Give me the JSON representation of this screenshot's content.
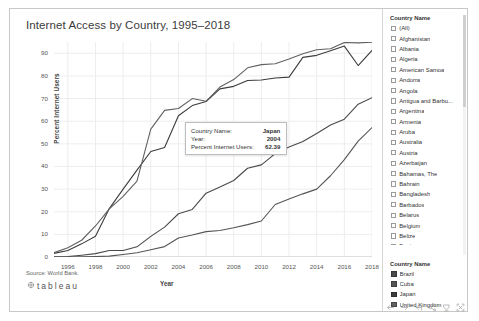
{
  "chart_title": "Internet Access by Country, 1995–2018",
  "source_note": "Source: World Bank.",
  "brand": "tableau",
  "axes": {
    "xlabel": "Year",
    "ylabel": "Percent Internet Users"
  },
  "tooltip": {
    "row1_label": "Country Name:",
    "row1_value": "Japan",
    "row2_label": "Year:",
    "row2_value": "2004",
    "row3_label": "Percent Internet Users:",
    "row3_value": "62.39"
  },
  "filter": {
    "header": "Country Name",
    "items": [
      {
        "label": "(All)",
        "checked": false
      },
      {
        "label": "Afghanistan",
        "checked": false
      },
      {
        "label": "Albania",
        "checked": false
      },
      {
        "label": "Algeria",
        "checked": false
      },
      {
        "label": "American Samoa",
        "checked": false
      },
      {
        "label": "Andorra",
        "checked": false
      },
      {
        "label": "Angola",
        "checked": false
      },
      {
        "label": "Antigua and Barbu...",
        "checked": false
      },
      {
        "label": "Argentina",
        "checked": false
      },
      {
        "label": "Armenia",
        "checked": false
      },
      {
        "label": "Aruba",
        "checked": false
      },
      {
        "label": "Australia",
        "checked": false
      },
      {
        "label": "Austria",
        "checked": false
      },
      {
        "label": "Azerbaijan",
        "checked": false
      },
      {
        "label": "Bahamas, The",
        "checked": false
      },
      {
        "label": "Bahrain",
        "checked": false
      },
      {
        "label": "Bangladesh",
        "checked": false
      },
      {
        "label": "Barbados",
        "checked": false
      },
      {
        "label": "Belarus",
        "checked": false
      },
      {
        "label": "Belgium",
        "checked": false
      },
      {
        "label": "Belize",
        "checked": false
      },
      {
        "label": "Benin",
        "checked": false
      },
      {
        "label": "Bermuda",
        "checked": false
      },
      {
        "label": "Bhutan",
        "checked": false
      },
      {
        "label": "Bolivia",
        "checked": false
      }
    ]
  },
  "color_legend": {
    "header": "Country Name",
    "items": [
      {
        "label": "Brazil",
        "color": "#4a4a4a"
      },
      {
        "label": "Cuba",
        "color": "#555555"
      },
      {
        "label": "Japan",
        "color": "#3c3c3c"
      },
      {
        "label": "United Kingdom",
        "color": "#606060"
      }
    ]
  },
  "toolbar": {
    "items": [
      {
        "name": "back-icon",
        "title": "Back"
      },
      {
        "name": "forward-icon",
        "title": "Forward"
      },
      {
        "name": "revert-icon",
        "title": "Revert"
      },
      {
        "name": "share-icon",
        "title": "Share"
      },
      {
        "name": "download-icon",
        "title": "Download"
      },
      {
        "name": "fullscreen-icon",
        "title": "Full Screen"
      }
    ]
  },
  "chart_data": {
    "type": "line",
    "title": "Internet Access by Country, 1995–2018",
    "xlabel": "Year",
    "ylabel": "Percent Internet Users",
    "xlim": [
      1995,
      2018
    ],
    "ylim": [
      0,
      95
    ],
    "xticks": [
      1996,
      1998,
      2000,
      2002,
      2004,
      2006,
      2008,
      2010,
      2012,
      2014,
      2016,
      2018
    ],
    "yticks": [
      0,
      10,
      20,
      30,
      40,
      50,
      60,
      70,
      80,
      90
    ],
    "grid": true,
    "legend_position": "right",
    "x": [
      1995,
      1996,
      1997,
      1998,
      1999,
      2000,
      2001,
      2002,
      2003,
      2004,
      2005,
      2006,
      2007,
      2008,
      2009,
      2010,
      2011,
      2012,
      2013,
      2014,
      2015,
      2016,
      2017,
      2018
    ],
    "series": [
      {
        "name": "Japan",
        "color": "#3c3c3c",
        "values": [
          1.6,
          2.9,
          5.8,
          9.2,
          21.4,
          30.0,
          38.4,
          46.6,
          48.4,
          62.39,
          66.9,
          68.7,
          74.3,
          75.4,
          78.0,
          78.2,
          79.1,
          79.5,
          88.2,
          89.1,
          91.1,
          93.2,
          84.6,
          91.3
        ]
      },
      {
        "name": "United Kingdom",
        "color": "#606060",
        "values": [
          1.9,
          4.1,
          7.4,
          13.7,
          21.3,
          26.8,
          33.5,
          56.5,
          64.8,
          65.6,
          70.0,
          68.8,
          75.1,
          78.4,
          83.6,
          85.0,
          85.4,
          87.5,
          89.8,
          91.6,
          92.0,
          94.8,
          94.6,
          94.9
        ]
      },
      {
        "name": "Brazil",
        "color": "#4a4a4a",
        "values": [
          0.1,
          0.2,
          0.8,
          1.5,
          2.9,
          2.9,
          4.5,
          9.1,
          13.2,
          19.1,
          21.0,
          28.2,
          30.9,
          33.8,
          39.2,
          40.7,
          45.7,
          48.6,
          51.0,
          54.6,
          58.3,
          60.9,
          67.5,
          70.4
        ]
      },
      {
        "name": "Cuba",
        "color": "#555555",
        "values": [
          0.0,
          0.0,
          0.1,
          0.2,
          0.4,
          1.1,
          1.9,
          3.2,
          4.6,
          8.4,
          9.7,
          11.2,
          11.7,
          12.9,
          14.3,
          15.9,
          23.2,
          25.6,
          27.9,
          30.0,
          35.9,
          43.0,
          51.2,
          57.2
        ]
      }
    ]
  }
}
